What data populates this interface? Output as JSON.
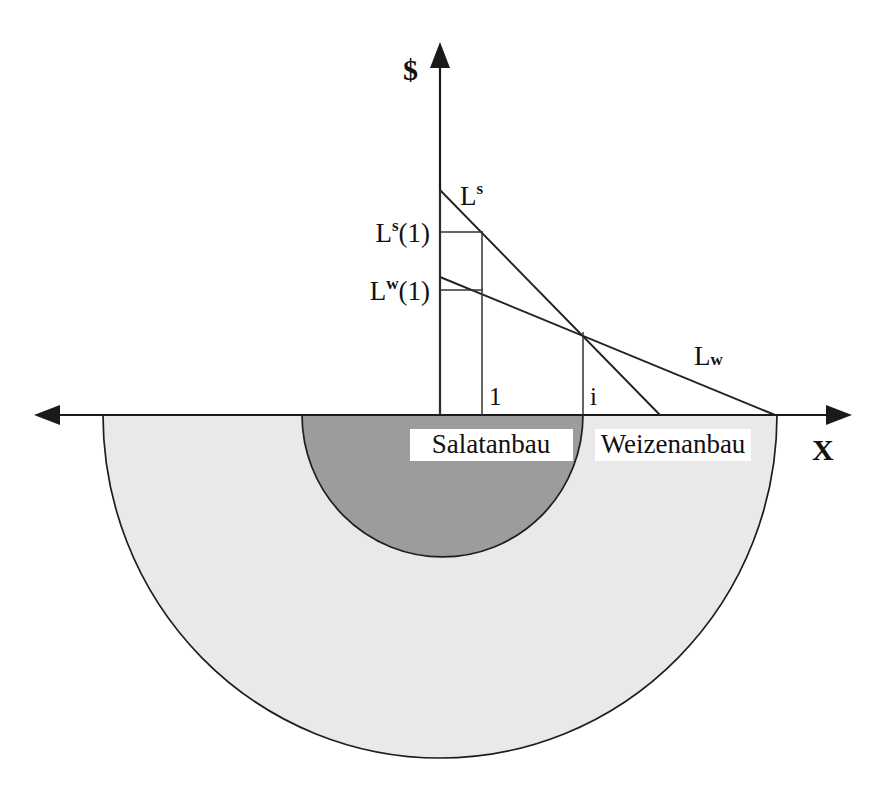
{
  "figure": {
    "axes": {
      "y_label": "$",
      "x_label": "X",
      "y_axis_x": 440,
      "x_axis_y": 415
    },
    "curves": [
      {
        "id": "Ls",
        "label_base": "L",
        "label_sup": "s",
        "label_x": 470,
        "label_y": 205,
        "intercept_y": 190,
        "x_intercept": 660,
        "description": "Bid rent curve for Salatanbau (lettuce), steeper slope"
      },
      {
        "id": "Lw",
        "label_base": "L",
        "label_sup": "w",
        "label_x": 700,
        "label_y": 365,
        "intercept_y": 277,
        "x_intercept": 775,
        "description": "Bid rent curve for Weizenanbau (wheat), flatter slope"
      }
    ],
    "value_labels": [
      {
        "id": "Ls1",
        "base": "L",
        "sup": "s",
        "suffix": "(1)",
        "x": 380,
        "y": 242,
        "level_y": 232
      },
      {
        "id": "Lw1",
        "base": "L",
        "sup": "w",
        "suffix": "(1)",
        "x": 380,
        "y": 300,
        "level_y": 290
      }
    ],
    "tick_labels": [
      {
        "id": "tick-1",
        "text": "1",
        "x": 489,
        "y": 405,
        "line_x": 482
      },
      {
        "id": "tick-i",
        "text": "i",
        "x": 590,
        "y": 405,
        "line_x": 583
      }
    ],
    "regions": [
      {
        "id": "salatanbau",
        "label": "Salatanbau",
        "label_x": 490,
        "label_y": 452,
        "color": "#9c9c9c",
        "left_x": 302,
        "right_x": 583,
        "bottom_y": 557
      },
      {
        "id": "weizenanbau",
        "label": "Weizenanbau",
        "label_x": 672,
        "label_y": 452,
        "color": "#e9e9e9",
        "left_x": 103,
        "right_x": 777,
        "bottom_y": 758
      }
    ],
    "intersection": {
      "x": 583,
      "y": 332
    },
    "colors": {
      "dark_region": "#9c9c9c",
      "light_region": "#e9e9e9",
      "line": "#1a1a1a",
      "background": "#ffffff"
    }
  }
}
